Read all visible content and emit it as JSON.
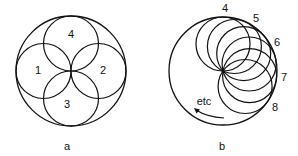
{
  "figure_a": {
    "caption": "a",
    "outer_circle": {
      "cx": 71,
      "cy": 71,
      "r": 55
    },
    "inner_circles": [
      {
        "label": "1",
        "cx": 43.5,
        "cy": 71,
        "r": 27.5,
        "label_x": 38,
        "label_y": 70
      },
      {
        "label": "2",
        "cx": 98.5,
        "cy": 71,
        "r": 27.5,
        "label_x": 103,
        "label_y": 70
      },
      {
        "label": "3",
        "cx": 71,
        "cy": 98.5,
        "r": 27.5,
        "label_x": 67,
        "label_y": 104
      },
      {
        "label": "4",
        "cx": 71,
        "cy": 43.5,
        "r": 27.5,
        "label_x": 71,
        "label_y": 34
      }
    ],
    "caption_pos": {
      "x": 67,
      "y": 146
    }
  },
  "figure_b": {
    "caption": "b",
    "outer_circle": {
      "cx": 223,
      "cy": 71,
      "r": 54
    },
    "inner_circle_radius": 27,
    "inner_circle_angles_deg": [
      90,
      65,
      40,
      15,
      -10,
      -35
    ],
    "labels": [
      {
        "text": "4",
        "x": 225,
        "y": 8
      },
      {
        "text": "5",
        "x": 256,
        "y": 18
      },
      {
        "text": "6",
        "x": 277,
        "y": 42
      },
      {
        "text": "7",
        "x": 284,
        "y": 77
      },
      {
        "text": "8",
        "x": 275,
        "y": 107
      }
    ],
    "etc_label": {
      "text": "etc",
      "x": 204,
      "y": 101
    },
    "caption_pos": {
      "x": 222,
      "y": 146
    }
  },
  "stroke_color": "#111111"
}
